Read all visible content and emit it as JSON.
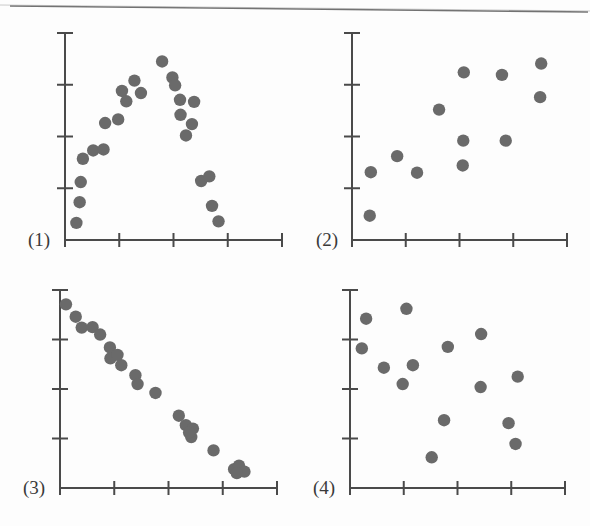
{
  "figure": {
    "background_color": "#fdfdfd",
    "dot_color": "#6a6a6a",
    "axis_color": "#4a4a4a",
    "dot_radius": 6.2,
    "panel_labels": [
      "(1)",
      "(2)",
      "(3)",
      "(4)"
    ]
  },
  "chart_data": [
    {
      "type": "scatter",
      "title": "(1)",
      "panel": 1,
      "xlabel": "",
      "ylabel": "",
      "xlim": [
        0,
        4
      ],
      "ylim": [
        0,
        4
      ],
      "grid": false,
      "legend": false,
      "x_ticks": [
        0,
        1,
        2,
        3,
        4
      ],
      "y_ticks": [
        0,
        1,
        2,
        3,
        4
      ],
      "x_tick_labels": [
        "",
        "",
        "",
        "",
        ""
      ],
      "y_tick_labels": [
        "",
        "",
        "",
        "",
        ""
      ],
      "pattern": "inverted-u / curvilinear",
      "n_points": 24,
      "points": [
        [
          0.21,
          0.33
        ],
        [
          0.27,
          0.73
        ],
        [
          0.29,
          1.12
        ],
        [
          0.33,
          1.57
        ],
        [
          0.52,
          1.73
        ],
        [
          0.71,
          1.75
        ],
        [
          0.74,
          2.26
        ],
        [
          1.05,
          2.88
        ],
        [
          1.13,
          2.68
        ],
        [
          1.28,
          3.08
        ],
        [
          1.4,
          2.84
        ],
        [
          1.79,
          3.45
        ],
        [
          1.98,
          3.14
        ],
        [
          2.03,
          2.99
        ],
        [
          2.12,
          2.71
        ],
        [
          2.13,
          2.42
        ],
        [
          2.34,
          2.24
        ],
        [
          2.38,
          2.67
        ],
        [
          2.51,
          1.14
        ],
        [
          2.66,
          1.23
        ],
        [
          2.71,
          0.66
        ],
        [
          2.83,
          0.36
        ],
        [
          0.98,
          2.33
        ],
        [
          2.23,
          2.02
        ]
      ]
    },
    {
      "type": "scatter",
      "title": "(2)",
      "panel": 2,
      "xlabel": "",
      "ylabel": "",
      "xlim": [
        0,
        4
      ],
      "ylim": [
        0,
        4
      ],
      "grid": false,
      "legend": false,
      "x_ticks": [
        0,
        1,
        2,
        3,
        4
      ],
      "y_ticks": [
        0,
        1,
        2,
        3,
        4
      ],
      "x_tick_labels": [
        "",
        "",
        "",
        "",
        ""
      ],
      "y_tick_labels": [
        "",
        "",
        "",
        "",
        ""
      ],
      "pattern": "moderate positive association",
      "n_points": 12,
      "points": [
        [
          0.33,
          0.47
        ],
        [
          0.35,
          1.31
        ],
        [
          0.84,
          1.62
        ],
        [
          1.21,
          1.3
        ],
        [
          1.62,
          2.52
        ],
        [
          2.08,
          3.24
        ],
        [
          2.07,
          1.92
        ],
        [
          2.06,
          1.44
        ],
        [
          2.79,
          3.19
        ],
        [
          2.86,
          1.92
        ],
        [
          3.52,
          3.41
        ],
        [
          3.5,
          2.76
        ]
      ]
    },
    {
      "type": "scatter",
      "title": "(3)",
      "panel": 3,
      "xlabel": "",
      "ylabel": "",
      "xlim": [
        0,
        4
      ],
      "ylim": [
        0,
        4
      ],
      "grid": false,
      "legend": false,
      "x_ticks": [
        0,
        1,
        2,
        3,
        4
      ],
      "y_ticks": [
        0,
        1,
        2,
        3,
        4
      ],
      "x_tick_labels": [
        "",
        "",
        "",
        "",
        ""
      ],
      "y_tick_labels": [
        "",
        "",
        "",
        "",
        ""
      ],
      "pattern": "strong negative linear association",
      "n_points": 22,
      "points": [
        [
          0.11,
          3.71
        ],
        [
          0.29,
          3.46
        ],
        [
          0.4,
          3.24
        ],
        [
          0.6,
          3.25
        ],
        [
          0.92,
          2.84
        ],
        [
          0.93,
          2.62
        ],
        [
          1.13,
          2.48
        ],
        [
          1.39,
          2.28
        ],
        [
          1.43,
          2.1
        ],
        [
          1.76,
          1.92
        ],
        [
          2.19,
          1.46
        ],
        [
          2.32,
          1.27
        ],
        [
          2.45,
          1.2
        ],
        [
          2.42,
          1.03
        ],
        [
          2.83,
          0.76
        ],
        [
          3.21,
          0.38
        ],
        [
          3.3,
          0.45
        ],
        [
          3.4,
          0.33
        ],
        [
          1.06,
          2.69
        ],
        [
          2.38,
          1.12
        ],
        [
          3.26,
          0.3
        ],
        [
          0.74,
          3.1
        ]
      ]
    },
    {
      "type": "scatter",
      "title": "(4)",
      "panel": 4,
      "xlabel": "",
      "ylabel": "",
      "xlim": [
        0,
        4
      ],
      "ylim": [
        0,
        4
      ],
      "grid": false,
      "legend": false,
      "x_ticks": [
        0,
        1,
        2,
        3,
        4
      ],
      "y_ticks": [
        0,
        1,
        2,
        3,
        4
      ],
      "x_tick_labels": [
        "",
        "",
        "",
        "",
        ""
      ],
      "y_tick_labels": [
        "",
        "",
        "",
        "",
        ""
      ],
      "pattern": "no association / random scatter",
      "n_points": 14,
      "points": [
        [
          0.3,
          3.42
        ],
        [
          0.22,
          2.82
        ],
        [
          0.63,
          2.43
        ],
        [
          1.05,
          3.62
        ],
        [
          0.98,
          2.1
        ],
        [
          1.17,
          2.48
        ],
        [
          1.52,
          0.62
        ],
        [
          1.75,
          1.37
        ],
        [
          1.82,
          2.85
        ],
        [
          2.44,
          3.11
        ],
        [
          2.43,
          2.04
        ],
        [
          2.95,
          1.31
        ],
        [
          3.12,
          2.25
        ],
        [
          3.08,
          0.89
        ]
      ]
    }
  ]
}
